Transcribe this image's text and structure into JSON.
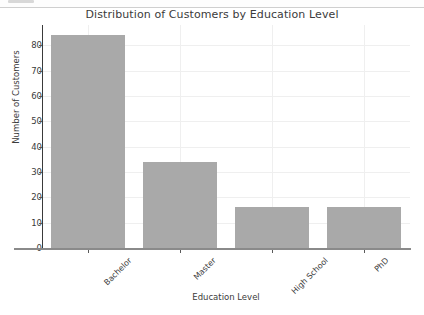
{
  "window": {
    "has_top_strip": true
  },
  "chart_data": {
    "type": "bar",
    "title": "Distribution of Customers by Education Level",
    "xlabel": "Education Level",
    "ylabel": "Number of Customers",
    "categories": [
      "Bachelor",
      "Master",
      "High School",
      "PhD"
    ],
    "values": [
      84,
      34,
      16,
      16
    ],
    "ylim": [
      0,
      88
    ],
    "yticks": [
      0,
      10,
      20,
      30,
      40,
      50,
      60,
      70,
      80
    ],
    "ytick_labels": [
      "0",
      "10",
      "20",
      "30",
      "40",
      "50",
      "60",
      "70",
      "80"
    ],
    "grid": true,
    "legend": null,
    "bar_color": "#a9a9a9",
    "grid_color": "#efefef",
    "text_color": "#3b3b3b",
    "xtick_rotation": -45
  }
}
